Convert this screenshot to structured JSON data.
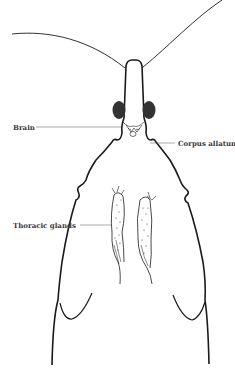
{
  "diagram": {
    "colors": {
      "outline": "#1a1a1a",
      "eye_fill": "#333333",
      "label_text": "#3a3a3a",
      "leader_line": "#555555",
      "background": "#ffffff"
    },
    "labels": {
      "brain": "Brain",
      "corpus_allatum": "Corpus allatum",
      "thoracic_glands": "Thoracic glands"
    },
    "label_positions": {
      "brain": {
        "x": 13,
        "y": 124
      },
      "corpus_allatum": {
        "x": 178,
        "y": 140
      },
      "thoracic_glands": {
        "x": 13,
        "y": 222
      }
    }
  }
}
